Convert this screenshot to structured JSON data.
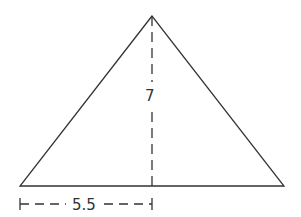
{
  "diagram": {
    "shape": "triangle",
    "vertices": {
      "apex": [
        152,
        16
      ],
      "bottom_left": [
        20,
        186
      ],
      "bottom_right": [
        284,
        186
      ]
    },
    "height_label": "7",
    "half_base_label": "5.5",
    "stroke_color": "#333333"
  }
}
